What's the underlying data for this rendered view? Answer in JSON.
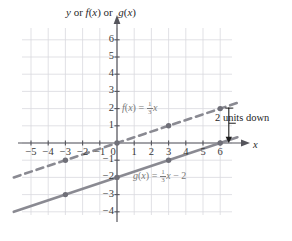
{
  "chart_data": {
    "type": "line",
    "xlabel": "x",
    "ylabel": "y or f(x) or g(x)",
    "xlim": [
      -6,
      7
    ],
    "ylim": [
      -4.5,
      7
    ],
    "grid": true,
    "grid_color": "#d9d9de",
    "axis_color": "#55555c",
    "series": [
      {
        "name": "f(x) = 1/3x",
        "label_text": "f(x) = ",
        "label_frac_num": "1",
        "label_frac_den": "3",
        "label_tail": "x",
        "style": "dashed",
        "color": "#8a8a92",
        "slope": 0.3333333,
        "intercept": 0,
        "x_start": -6,
        "x_end": 7,
        "points": [
          [
            -3,
            -1
          ],
          [
            0,
            0
          ],
          [
            3,
            1
          ],
          [
            6,
            2
          ]
        ]
      },
      {
        "name": "g(x) = 1/3x - 2",
        "label_text": "g(x) = ",
        "label_frac_num": "1",
        "label_frac_den": "3",
        "label_tail": "x − 2",
        "style": "solid",
        "color": "#8a8a92",
        "slope": 0.3333333,
        "intercept": -2,
        "x_start": -6,
        "x_end": 7,
        "points": [
          [
            -3,
            -3
          ],
          [
            0,
            -2
          ],
          [
            3,
            -1
          ],
          [
            6,
            0
          ]
        ]
      }
    ],
    "x_ticks": [
      "−5",
      "−4",
      "−3",
      "−2",
      "−1",
      "0",
      "1",
      "2",
      "3",
      "4",
      "5",
      "6"
    ],
    "x_tick_values": [
      -5,
      -4,
      -3,
      -2,
      -1,
      0,
      1,
      2,
      3,
      4,
      5,
      6
    ],
    "y_ticks": [
      "6",
      "5",
      "4",
      "3",
      "2",
      "1",
      "−1",
      "−2",
      "−3",
      "−4"
    ],
    "y_tick_values": [
      6,
      5,
      4,
      3,
      2,
      1,
      -1,
      -2,
      -3,
      -4
    ],
    "annotation": {
      "text": "2 units down",
      "arrow": "down",
      "at_x": 6.5,
      "from_y": 2,
      "to_y": 0
    }
  }
}
